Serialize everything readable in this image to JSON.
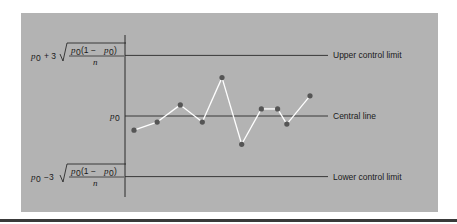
{
  "chart_data": {
    "type": "line",
    "title": "",
    "xlabel": "",
    "ylabel": "",
    "ylim": [
      -3.9,
      3.9
    ],
    "y_units": "standard deviations from p0",
    "x": [
      1,
      2.0,
      3.0,
      3.95,
      4.8,
      5.65,
      6.5,
      7.2,
      7.6,
      8.6
    ],
    "xlim": [
      0.6,
      9.0
    ],
    "values": [
      -0.7,
      -0.3,
      0.55,
      -0.3,
      1.9,
      -1.4,
      0.35,
      0.35,
      -0.4,
      1.0
    ],
    "reference_lines": [
      {
        "name": "upper-control-limit",
        "y": 3,
        "label": "Upper control limit"
      },
      {
        "name": "central-line",
        "y": 0,
        "label": "Central line"
      },
      {
        "name": "lower-control-limit",
        "y": -3,
        "label": "Lower control limit"
      }
    ],
    "y_tick_labels": {
      "upper": {
        "p": "p",
        "sub": "0",
        "op": "+ 3",
        "num_a": "p",
        "num_a_sub": "0",
        "num_b": "(1 − ",
        "num_c": "p",
        "num_c_sub": "0",
        "num_d": ")",
        "den": "n"
      },
      "central": {
        "p": "p",
        "sub": "0"
      },
      "lower": {
        "p": "p",
        "sub": "0",
        "op": "−3",
        "num_a": "p",
        "num_a_sub": "0",
        "num_b": "(1 − ",
        "num_c": "p",
        "num_c_sub": "0",
        "num_d": ")",
        "den": "n"
      }
    },
    "colors": {
      "panel": "#b3b3b3",
      "line": "#ffffff",
      "points": "#555555",
      "reference": "#2a2a2a"
    },
    "grid": false,
    "legend": "none"
  }
}
